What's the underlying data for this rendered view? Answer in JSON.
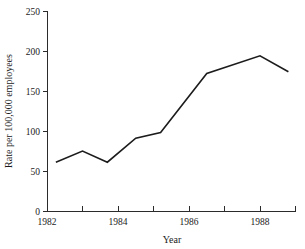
{
  "chart_data": {
    "type": "line",
    "title": "",
    "xlabel": "Year",
    "ylabel": "Rate per 100,000 employees",
    "xlim": [
      1982,
      1989
    ],
    "ylim": [
      0,
      250
    ],
    "grid": false,
    "legend": "none",
    "x_ticks_major": [
      1982,
      1984,
      1986,
      1988,
      1990
    ],
    "x_tick_labels": [
      "1982",
      "1984",
      "1986",
      "1988",
      "1990"
    ],
    "x_ticks_minor": [
      1983,
      1985,
      1987,
      1989,
      1991
    ],
    "y_ticks": [
      0,
      50,
      100,
      150,
      200,
      250
    ],
    "y_tick_labels": [
      "0",
      "50",
      "100",
      "150",
      "200",
      "250"
    ],
    "x": [
      1982.25,
      1983.0,
      1983.7,
      1984.5,
      1985.2,
      1986.5,
      1988.0,
      1988.8
    ],
    "values": [
      61,
      75,
      61,
      91,
      98,
      172,
      194,
      174
    ],
    "series": [
      {
        "name": "Rate per 100,000 employees",
        "values": [
          61,
          75,
          61,
          91,
          98,
          172,
          194,
          174
        ]
      }
    ],
    "line_color": "#1c1c1c"
  },
  "axes": {
    "x_title": "Year",
    "y_title": "Rate per 100,000 employees"
  }
}
